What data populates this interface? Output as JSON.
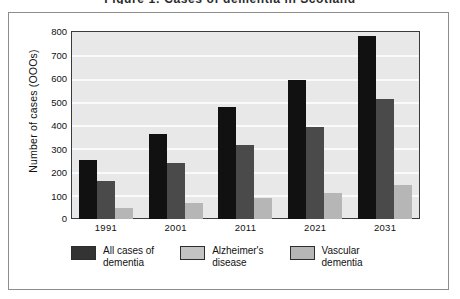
{
  "figure": {
    "title": "Figure 1: Cases of dementia in Scotland",
    "frame_border_color": "#8d8d8d",
    "plot_background": "#e8e8e8"
  },
  "chart_data": {
    "type": "bar",
    "title": "Figure 1: Cases of dementia in Scotland",
    "xlabel": "",
    "ylabel": "Number of cases (OOOs)",
    "categories": [
      "1991",
      "2001",
      "2011",
      "2021",
      "2031"
    ],
    "ylim": [
      0,
      800
    ],
    "yticks": [
      800,
      700,
      600,
      500,
      400,
      300,
      200,
      100,
      0
    ],
    "ytick_labels": [
      "800",
      "700",
      "600",
      "500",
      "400",
      "300",
      "200",
      "100",
      "0"
    ],
    "grid": true,
    "legend_position": "bottom",
    "series": [
      {
        "name": "All cases of\ndementia",
        "color": "#111111",
        "legend_color": "#333333",
        "values": [
          250,
          363,
          478,
          592,
          780
        ]
      },
      {
        "name": "Alzheimer's\ndisease",
        "color": "#4a4a4a",
        "legend_color": "#c3c3c3",
        "values": [
          163,
          240,
          315,
          392,
          510
        ]
      },
      {
        "name": "Vascular\ndementia",
        "color": "#b6b6b6",
        "legend_color": "#b6b6b6",
        "values": [
          48,
          68,
          88,
          110,
          145
        ]
      }
    ]
  }
}
